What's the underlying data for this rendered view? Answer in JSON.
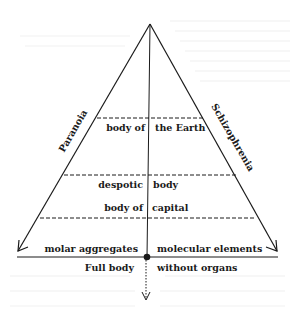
{
  "diagram": {
    "sides": {
      "left": "Paranoia",
      "right": "Schizophrenia"
    },
    "layers": [
      {
        "left": "body of",
        "right": "the Earth"
      },
      {
        "left": "despotic",
        "right": "body"
      },
      {
        "left": "body of",
        "right": "capital"
      }
    ],
    "base": {
      "above_left": "molar aggregates",
      "above_right": "molecular elements",
      "below_left": "Full body",
      "below_right": "without organs"
    },
    "colors": {
      "ink": "#1a1a1a",
      "paper": "#ffffff"
    }
  }
}
